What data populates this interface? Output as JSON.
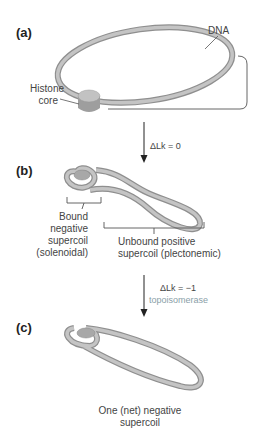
{
  "panels": {
    "a": {
      "label": "(a)",
      "dna_label": "DNA",
      "histone_label_line1": "Histone",
      "histone_label_line2": "core"
    },
    "b": {
      "label": "(b)",
      "bound_lines": [
        "Bound",
        "negative",
        "supercoil",
        "(solenoidal)"
      ],
      "unbound_lines": [
        "Unbound positive",
        "supercoil (plectonemic)"
      ]
    },
    "c": {
      "label": "(c)",
      "caption_lines": [
        "One (net) negative",
        "supercoil"
      ]
    }
  },
  "arrows": {
    "first": {
      "label": "ΔLk = 0"
    },
    "second": {
      "label": "ΔLk = −1",
      "enzyme": "topoisomerase"
    }
  },
  "colors": {
    "dna": "#b9b9b9",
    "dna_edge": "#8f8f8f",
    "histone": "#a9a9a9",
    "enzyme_text": "#8aa0a8"
  }
}
